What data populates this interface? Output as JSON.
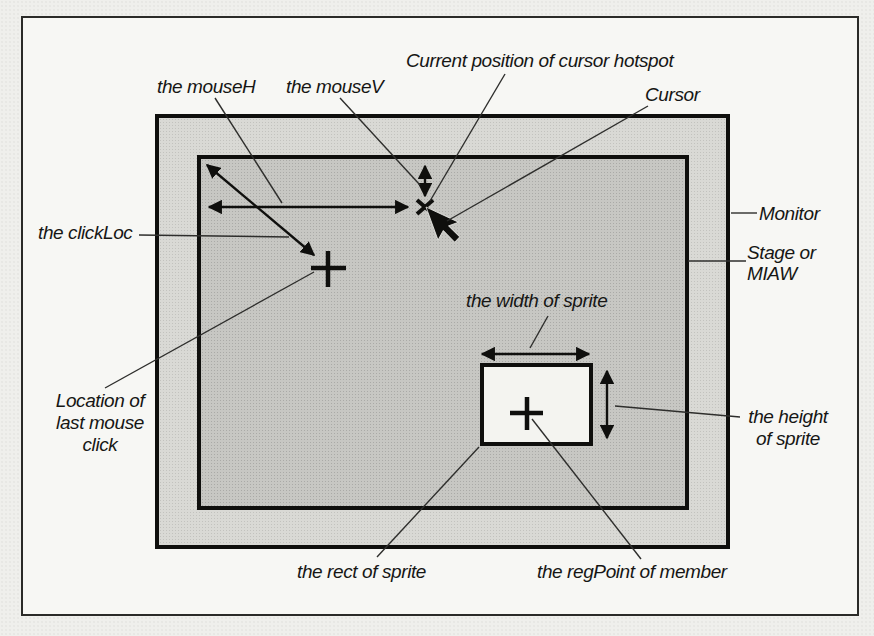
{
  "figure": {
    "type": "book-diagram",
    "topic": "mouse and sprite coordinate properties on the Director stage",
    "labels": {
      "mouseH": "the mouseH",
      "mouseV": "the mouseV",
      "cursor_hotspot": "Current position of cursor hotspot",
      "cursor": "Cursor",
      "clickLoc": "the clickLoc",
      "monitor": "Monitor",
      "stage_or_miaw": "Stage or\nMIAW",
      "last_mouse_click": "Location of\nlast mouse\nclick",
      "sprite_width": "the width of sprite",
      "sprite_height": "the height\nof sprite",
      "sprite_rect": "the rect of sprite",
      "regPoint": "the regPoint of member"
    },
    "colors": {
      "paper": "#efefec",
      "frame_fill": "#f7f7f4",
      "frame_border": "#2a2a28",
      "monitor_fill": "#d9d9d5",
      "stage_fill": "#c7c7c3",
      "sprite_fill": "#f4f4f0",
      "ink": "#0f0f0d"
    }
  }
}
